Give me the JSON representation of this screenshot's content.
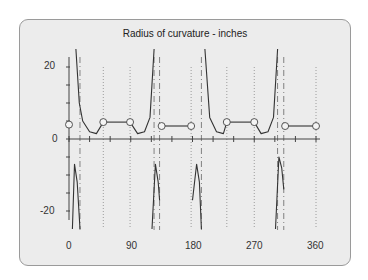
{
  "chart_data": {
    "type": "line",
    "title": "Radius of curvature - inches",
    "xlabel": "",
    "ylabel": "",
    "xlim": [
      0,
      360
    ],
    "ylim": [
      -25,
      25
    ],
    "x_ticks": [
      "0",
      "90",
      "180",
      "270",
      "360"
    ],
    "y_ticks": [
      "20",
      "0",
      "-20"
    ],
    "grid": "dotted vertical lines at segment boundaries",
    "legend": null,
    "segments": [
      {
        "name": "flank-1",
        "x": [
          10,
          15,
          20,
          30,
          40,
          50
        ],
        "y": [
          25,
          10,
          5,
          2,
          1.5,
          4.7
        ]
      },
      {
        "name": "plateau-1",
        "x": [
          50,
          89
        ],
        "y": [
          4.7,
          4.7
        ]
      },
      {
        "name": "flank-2",
        "x": [
          89,
          100,
          110,
          118,
          124
        ],
        "y": [
          4.7,
          1.5,
          2,
          6,
          25
        ]
      },
      {
        "name": "plateau-2",
        "x": [
          135,
          178
        ],
        "y": [
          3.6,
          3.6
        ]
      },
      {
        "name": "flank-3",
        "x": [
          198,
          205,
          215,
          225,
          230
        ],
        "y": [
          25,
          6,
          2,
          1.5,
          4.7
        ]
      },
      {
        "name": "plateau-3",
        "x": [
          230,
          270
        ],
        "y": [
          4.7,
          4.7
        ]
      },
      {
        "name": "flank-4",
        "x": [
          270,
          280,
          290,
          298,
          304
        ],
        "y": [
          4.7,
          1.5,
          2,
          6,
          25
        ]
      },
      {
        "name": "plateau-4",
        "x": [
          315,
          360
        ],
        "y": [
          3.6,
          3.6
        ]
      },
      {
        "name": "negative-lobe-1",
        "x": [
          5,
          8,
          12,
          16
        ],
        "y": [
          -25,
          -7,
          -12,
          -25
        ]
      },
      {
        "name": "negative-lobe-2",
        "x": [
          121,
          126,
          130,
          132
        ],
        "y": [
          -25,
          -7,
          -12,
          -17
        ]
      },
      {
        "name": "negative-lobe-3",
        "x": [
          180,
          186,
          190,
          193
        ],
        "y": [
          -17,
          -7,
          -12,
          -25
        ]
      },
      {
        "name": "negative-lobe-4",
        "x": [
          301,
          306,
          310,
          313
        ],
        "y": [
          -25,
          -5,
          -8,
          -14
        ]
      }
    ],
    "markers": [
      {
        "x": 0,
        "y": 4
      },
      {
        "x": 50,
        "y": 4.7
      },
      {
        "x": 89,
        "y": 4.7
      },
      {
        "x": 135,
        "y": 3.6
      },
      {
        "x": 178,
        "y": 3.6
      },
      {
        "x": 230,
        "y": 4.7
      },
      {
        "x": 270,
        "y": 4.7
      },
      {
        "x": 315,
        "y": 3.6
      },
      {
        "x": 360,
        "y": 3.6
      }
    ],
    "dotted_gridlines_x": [
      50,
      89,
      178,
      230,
      270,
      360
    ],
    "dashed_asymptotes_x": [
      16,
      124,
      132,
      193,
      304,
      313
    ]
  }
}
